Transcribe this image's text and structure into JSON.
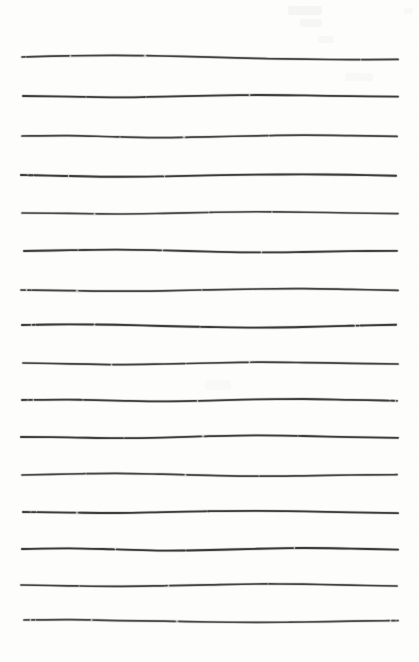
{
  "document": {
    "kind": "scanned-paper-sheet",
    "title": "Hand-drawn horizontal ruled lines",
    "description": "A white sheet of paper scanned at low contrast, bearing sixteen freehand horizontal ruled lines drawn in dark graphite/ink. The lines are slightly wavy, vary in thickness and darkness along their length, and show small breaks where the stroke skipped.",
    "visible_text": "",
    "page_width": 419,
    "page_height": 662,
    "background_color": "#fdfdfc",
    "ink_color": "#434343",
    "line_count": 16,
    "left_margin": 21,
    "right_margin": 20,
    "top_margin": 57,
    "bottom_margin": 42,
    "average_line_spacing": 38
  },
  "ghost_marks": [
    {
      "name": "faint-smudge-top-right-a",
      "x": 288,
      "y": 6,
      "w": 34,
      "h": 9,
      "opacity": 0.03
    },
    {
      "name": "faint-smudge-top-right-b",
      "x": 300,
      "y": 19,
      "w": 22,
      "h": 8,
      "opacity": 0.026
    },
    {
      "name": "faint-smudge-top-right-c",
      "x": 318,
      "y": 36,
      "w": 16,
      "h": 7,
      "opacity": 0.022
    },
    {
      "name": "faint-smudge-top-right-d",
      "x": 404,
      "y": 8,
      "w": 9,
      "h": 6,
      "opacity": 0.02
    },
    {
      "name": "faint-smudge-mid-right",
      "x": 345,
      "y": 73,
      "w": 28,
      "h": 8,
      "opacity": 0.018
    },
    {
      "name": "faint-smudge-center",
      "x": 205,
      "y": 380,
      "w": 26,
      "h": 10,
      "opacity": 0.016
    }
  ],
  "lines": [
    {
      "name": "ruled-line-1",
      "y": 57,
      "x1": 22,
      "x2": 398,
      "width": 1.7,
      "color": "#454545",
      "wave": [
        0,
        -1.2,
        -1.6,
        -1.0,
        0.2,
        1.4,
        2.2,
        2.6,
        2.4
      ],
      "dashes": "3 2 40 0 2 3 70 0 1 4 120 0 90 0"
    },
    {
      "name": "ruled-line-2",
      "y": 96,
      "x1": 23,
      "x2": 398,
      "width": 1.8,
      "color": "#3e3e3e",
      "wave": [
        0,
        0.6,
        1.4,
        0.6,
        -0.4,
        -1.0,
        -0.6,
        0.2,
        0.6
      ],
      "dashes": "60 0 2 2 55 0 3 2 100 0 1 3 150 0"
    },
    {
      "name": "ruled-line-3",
      "y": 136,
      "x1": 22,
      "x2": 397,
      "width": 1.7,
      "color": "#474747",
      "wave": [
        0,
        -0.4,
        0.8,
        1.6,
        0.8,
        -0.2,
        -0.8,
        -0.4,
        0.4
      ],
      "dashes": "95 0 2 2 60 0 1 4 80 0 2 2 130 0"
    },
    {
      "name": "ruled-line-4",
      "y": 175,
      "x1": 21,
      "x2": 396,
      "width": 1.9,
      "color": "#3d3d3d",
      "wave": [
        0,
        1.0,
        1.8,
        1.4,
        0.4,
        -0.4,
        -0.6,
        -0.2,
        0.8
      ],
      "dashes": "6 2 4 2 30 0 2 3 90 0 3 3 70 0 160 0"
    },
    {
      "name": "ruled-line-5",
      "y": 213,
      "x1": 22,
      "x2": 398,
      "width": 1.6,
      "color": "#4a4a4a",
      "wave": [
        0,
        0.4,
        1.0,
        0.4,
        -0.6,
        -1.2,
        -0.8,
        0.0,
        0.6
      ],
      "dashes": "70 0 1 3 110 0 2 2 60 0 1 2 125 0"
    },
    {
      "name": "ruled-line-6",
      "y": 251,
      "x1": 24,
      "x2": 397,
      "width": 1.8,
      "color": "#414141",
      "wave": [
        0,
        -0.8,
        -1.4,
        -0.6,
        0.6,
        1.4,
        1.0,
        0.2,
        -0.2
      ],
      "dashes": "50 0 3 2 80 0 2 3 95 0 1 3 135 0"
    },
    {
      "name": "ruled-line-7",
      "y": 290,
      "x1": 21,
      "x2": 398,
      "width": 1.7,
      "color": "#464646",
      "wave": [
        0,
        0.6,
        1.2,
        0.8,
        -0.2,
        -1.0,
        -1.4,
        -0.6,
        0.4
      ],
      "dashes": "4 3 3 2 40 0 2 4 120 0 2 2 90 0 105 0"
    },
    {
      "name": "ruled-line-8",
      "y": 325,
      "x1": 22,
      "x2": 396,
      "width": 1.9,
      "color": "#3c3c3c",
      "wave": [
        0,
        -0.6,
        -0.2,
        1.0,
        2.0,
        2.6,
        2.0,
        0.8,
        -0.2
      ],
      "dashes": "8 3 2 2 55 0 1 3 100 0 3 2 145 0"
    },
    {
      "name": "ruled-line-9",
      "y": 363,
      "x1": 23,
      "x2": 398,
      "width": 1.7,
      "color": "#444444",
      "wave": [
        0,
        0.8,
        1.6,
        1.0,
        0.0,
        -0.8,
        -0.4,
        0.4,
        1.0
      ],
      "dashes": "85 0 2 3 70 0 2 2 60 0 1 3 120 0"
    },
    {
      "name": "ruled-line-10",
      "y": 400,
      "x1": 22,
      "x2": 397,
      "width": 1.8,
      "color": "#404040",
      "wave": [
        0,
        -0.4,
        0.6,
        1.4,
        0.6,
        -0.6,
        -1.0,
        -0.2,
        0.8
      ],
      "dashes": "5 2 3 3 45 0 2 2 110 0 2 3 85 0 100 0"
    },
    {
      "name": "ruled-line-11",
      "y": 437,
      "x1": 21,
      "x2": 398,
      "width": 1.8,
      "color": "#3f3f3f",
      "wave": [
        0,
        0.4,
        1.2,
        0.6,
        -0.8,
        -1.6,
        -1.0,
        0.2,
        0.8
      ],
      "dashes": "100 0 2 2 75 0 1 4 90 0 2 2 100 0"
    },
    {
      "name": "ruled-line-12",
      "y": 475,
      "x1": 22,
      "x2": 397,
      "width": 1.7,
      "color": "#484848",
      "wave": [
        0,
        -1.0,
        -1.6,
        -0.8,
        0.4,
        1.2,
        0.8,
        0.0,
        -0.4
      ],
      "dashes": "60 0 3 2 95 0 2 3 70 0 1 2 135 0"
    },
    {
      "name": "ruled-line-13",
      "y": 512,
      "x1": 23,
      "x2": 398,
      "width": 1.8,
      "color": "#3e3e3e",
      "wave": [
        0,
        0.6,
        1.0,
        0.2,
        -0.8,
        -1.2,
        -0.6,
        0.4,
        1.2
      ],
      "dashes": "7 2 4 2 35 0 2 4 125 0 2 2 80 0 110 0"
    },
    {
      "name": "ruled-line-14",
      "y": 549,
      "x1": 22,
      "x2": 398,
      "width": 1.9,
      "color": "#3b3b3b",
      "wave": [
        0,
        -0.6,
        0.4,
        1.6,
        1.0,
        -0.2,
        -1.0,
        -0.4,
        0.6
      ],
      "dashes": "90 0 2 3 65 0 3 2 105 0 1 3 105 0"
    },
    {
      "name": "ruled-line-15",
      "y": 585,
      "x1": 21,
      "x2": 397,
      "width": 1.7,
      "color": "#454545",
      "wave": [
        0,
        0.8,
        1.4,
        0.8,
        -0.2,
        -1.0,
        -0.8,
        0.2,
        1.0
      ],
      "dashes": "55 0 2 2 85 0 2 3 95 0 2 2 130 0"
    },
    {
      "name": "ruled-line-16",
      "y": 620,
      "x1": 24,
      "x2": 398,
      "width": 1.7,
      "color": "#4b4b4b",
      "wave": [
        0,
        -0.4,
        0.6,
        1.2,
        2.0,
        2.4,
        2.0,
        1.2,
        0.6
      ],
      "dashes": "5 3 3 2 50 0 3 3 80 0 2 4 110 0 95 0"
    }
  ]
}
